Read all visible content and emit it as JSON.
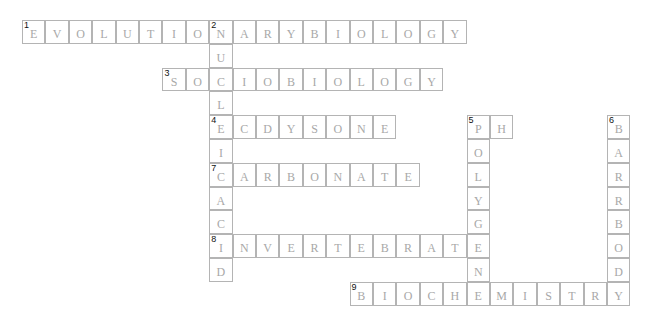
{
  "puzzle": {
    "cell_width": 23.4,
    "cell_height": 23.8,
    "words": [
      {
        "number": 1,
        "direction": "across",
        "row": 0,
        "col": 0,
        "answer": "EVOLUTIONARYBIOLOGY"
      },
      {
        "number": 2,
        "direction": "down",
        "row": 0,
        "col": 8,
        "answer": "NUCLEICACID"
      },
      {
        "number": 3,
        "direction": "across",
        "row": 2,
        "col": 6,
        "answer": "SOCIOBIOLOGY"
      },
      {
        "number": 4,
        "direction": "across",
        "row": 4,
        "col": 8,
        "answer": "ECDYSONE"
      },
      {
        "number": 5,
        "direction": "across",
        "row": 4,
        "col": 19,
        "answer": "PH"
      },
      {
        "number": 5,
        "direction": "down",
        "row": 4,
        "col": 19,
        "answer": "POLYGENE"
      },
      {
        "number": 6,
        "direction": "down",
        "row": 4,
        "col": 25,
        "answer": "BARRBODY"
      },
      {
        "number": 7,
        "direction": "across",
        "row": 6,
        "col": 8,
        "answer": "CARBONATE"
      },
      {
        "number": 8,
        "direction": "across",
        "row": 9,
        "col": 8,
        "answer": "INVERTEBRATE"
      },
      {
        "number": 9,
        "direction": "across",
        "row": 11,
        "col": 14,
        "answer": "BIOCHEMISTRY"
      }
    ]
  }
}
